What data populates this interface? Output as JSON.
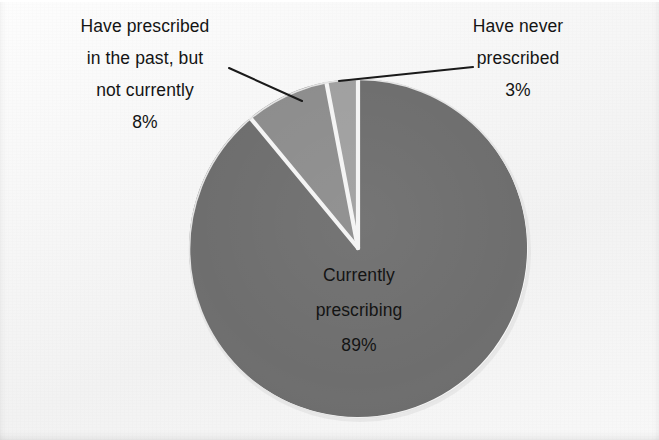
{
  "figure": {
    "background_color": "#f6f6f6",
    "slice_border_color": "#f4f4f4",
    "text_color": "#141414",
    "leader_line_color": "#1a1a1a"
  },
  "labels": {
    "left": {
      "lines": [
        "Have prescribed",
        "in the past, but",
        "not currently"
      ],
      "value": "8%"
    },
    "right": {
      "lines": [
        "Have never",
        "prescribed"
      ],
      "value": "3%"
    },
    "center": {
      "lines": [
        "Currently",
        "prescribing"
      ],
      "value": "89%"
    }
  },
  "chart_data": {
    "type": "pie",
    "title": "",
    "categories": [
      "Currently prescribing",
      "Have prescribed in the past, but not currently",
      "Have never prescribed"
    ],
    "values": [
      89,
      8,
      3
    ],
    "value_labels": [
      "89%",
      "8%",
      "3%"
    ],
    "unit": "percent",
    "total": 100,
    "colors": [
      "#6e6e6e",
      "#8d8d8d",
      "#a0a0a0"
    ],
    "start_angle_deg": 0,
    "direction": "counterclockwise",
    "legend": "none",
    "grid": false,
    "labels_position": [
      "inside",
      "outside-leader",
      "outside-leader"
    ],
    "exploded": false
  }
}
